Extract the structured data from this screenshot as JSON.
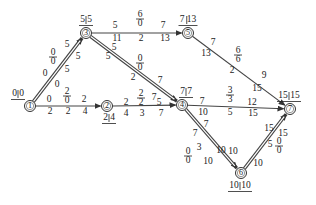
{
  "diagram": {
    "type": "activity-on-arrow network (double-arrow network with time parameters)",
    "nodes": [
      {
        "id": "1",
        "label": "1",
        "x": 30,
        "y": 106,
        "time": {
          "left": "0",
          "right": "0"
        },
        "time_pos": "top-left"
      },
      {
        "id": "2",
        "label": "2",
        "x": 107,
        "y": 106,
        "time": {
          "left": "2",
          "right": "4"
        },
        "time_pos": "bottom"
      },
      {
        "id": "3",
        "label": "3",
        "x": 86,
        "y": 33,
        "time": {
          "left": "5",
          "right": "5"
        },
        "time_pos": "top"
      },
      {
        "id": "4",
        "label": "4",
        "x": 182,
        "y": 105,
        "time": {
          "left": "7",
          "right": "7"
        },
        "time_pos": "top"
      },
      {
        "id": "5",
        "label": "5",
        "x": 188,
        "y": 33,
        "time": {
          "left": "7",
          "right": "13"
        },
        "time_pos": "top"
      },
      {
        "id": "6",
        "label": "6",
        "x": 241,
        "y": 173,
        "time": {
          "left": "10",
          "right": "10"
        },
        "time_pos": "bottom"
      },
      {
        "id": "7",
        "label": "7",
        "x": 290,
        "y": 109,
        "time": {
          "left": "15",
          "right": "15"
        },
        "time_pos": "top"
      }
    ],
    "edges": [
      {
        "from": "1",
        "to": "3",
        "critical": true,
        "duration": "5",
        "free_float": "0",
        "total_float": "0",
        "labels": {
          "es": "0",
          "ef": "5",
          "ls": "0",
          "lf": "5"
        }
      },
      {
        "from": "1",
        "to": "2",
        "critical": false,
        "duration": "2",
        "free_float": "0",
        "total_float": "2",
        "labels": {
          "es": "0",
          "ef": "2",
          "ls": "2",
          "lf": "4"
        }
      },
      {
        "from": "3",
        "to": "5",
        "critical": false,
        "duration": "2",
        "free_float": "0",
        "total_float": "6",
        "labels": {
          "es": "5",
          "ef": "7",
          "ls": "11",
          "lf": "13"
        }
      },
      {
        "from": "3",
        "to": "4",
        "critical": true,
        "duration": "2",
        "free_float": "0",
        "total_float": "0",
        "labels": {
          "es": "5",
          "ef": "7",
          "ls": "5",
          "lf": "7"
        }
      },
      {
        "from": "2",
        "to": "4",
        "critical": false,
        "duration": "3",
        "free_float": "2",
        "total_float": "2",
        "labels": {
          "es": "2",
          "ef": "5",
          "ls": "4",
          "lf": "7"
        }
      },
      {
        "from": "5",
        "to": "7",
        "critical": false,
        "duration": "2",
        "free_float": "6",
        "total_float": "6",
        "labels": {
          "es": "7",
          "ef": "9",
          "ls": "13",
          "lf": "15"
        }
      },
      {
        "from": "4",
        "to": "7",
        "critical": false,
        "duration": "5",
        "free_float": "3",
        "total_float": "3",
        "labels": {
          "es": "7",
          "ef": "12",
          "ls": "10",
          "lf": "15"
        }
      },
      {
        "from": "4",
        "to": "6",
        "critical": true,
        "duration": "3",
        "free_float": "0",
        "total_float": "0",
        "labels": {
          "es": "7",
          "ef": "10",
          "ls": "7",
          "lf": "10"
        }
      },
      {
        "from": "6",
        "to": "7",
        "critical": true,
        "duration": "5",
        "free_float": "0",
        "total_float": "0",
        "labels": {
          "es": "10",
          "ef": "15",
          "ls": "10",
          "lf": "15"
        }
      }
    ],
    "colors": {
      "line": "#444444",
      "critical_fill": "#888888",
      "text": "#222222",
      "background": "#ffffff"
    }
  }
}
